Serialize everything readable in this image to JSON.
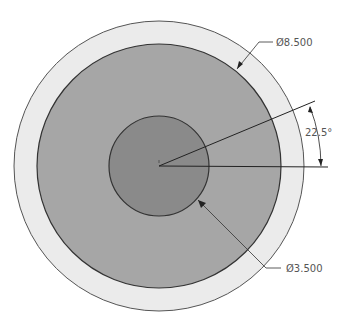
{
  "drawing": {
    "type": "concentric circles technical drawing",
    "center": [
      159,
      166
    ],
    "circles": [
      {
        "name": "outer",
        "radius_px": 145,
        "fill": "#ebebeb",
        "stroke": "#555555"
      },
      {
        "name": "middle",
        "radius_px": 122,
        "fill": "#a6a6a6",
        "stroke": "#333333"
      },
      {
        "name": "inner",
        "radius_px": 50,
        "fill": "#8a8a8a",
        "stroke": "#333333"
      }
    ],
    "dimensions": {
      "outer_diameter": {
        "label": "Ø8.500",
        "value": 8.5
      },
      "inner_diameter": {
        "label": "Ø3.500",
        "value": 3.5
      },
      "angle": {
        "label": "22.5°",
        "value": 22.5
      }
    }
  }
}
